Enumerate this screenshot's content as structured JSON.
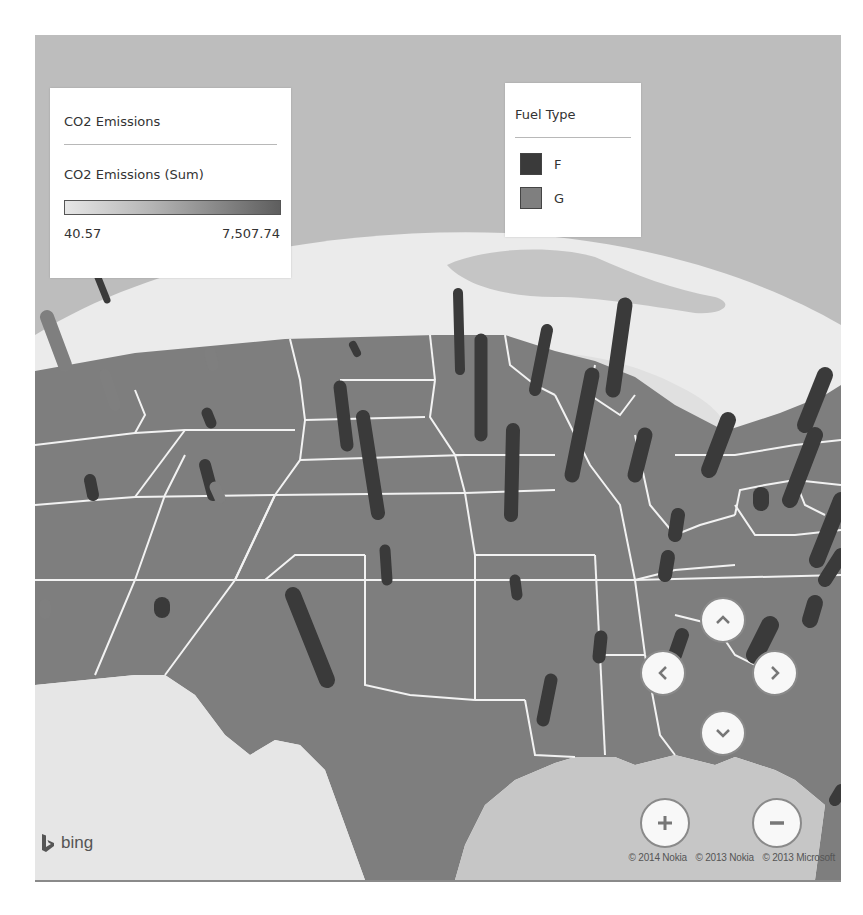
{
  "map": {
    "provider": "bing",
    "copyright": [
      "© 2014 Nokia",
      "© 2013 Nokia",
      "© 2013 Microsoft"
    ],
    "colors": {
      "sky": "#bdbdbd",
      "snow": "#ececec",
      "water": "#c4c4c4",
      "land_outside": "#e4e4e4",
      "states": "#7e7e7e",
      "state_border": "#f2f2f2",
      "fuel_F": "#3a3a3a",
      "fuel_G": "#7f7f7f"
    }
  },
  "color_legend": {
    "title": "CO2 Emissions",
    "measure": "CO2 Emissions (Sum)",
    "min_label": "40.57",
    "max_label": "7,507.74",
    "min_value": 40.57,
    "max_value": 7507.74,
    "gradient": [
      "#e6e6e6",
      "#5e5e5e"
    ]
  },
  "category_legend": {
    "title": "Fuel Type",
    "items": [
      {
        "label": "F",
        "color": "#3a3a3a"
      },
      {
        "label": "G",
        "color": "#7f7f7f"
      }
    ]
  },
  "controls": {
    "pan_up": "chevron-up-icon",
    "pan_left": "chevron-left-icon",
    "pan_right": "chevron-right-icon",
    "pan_down": "chevron-down-icon",
    "zoom_in": "plus-icon",
    "zoom_out": "minus-icon"
  },
  "logo_text": "bing"
}
